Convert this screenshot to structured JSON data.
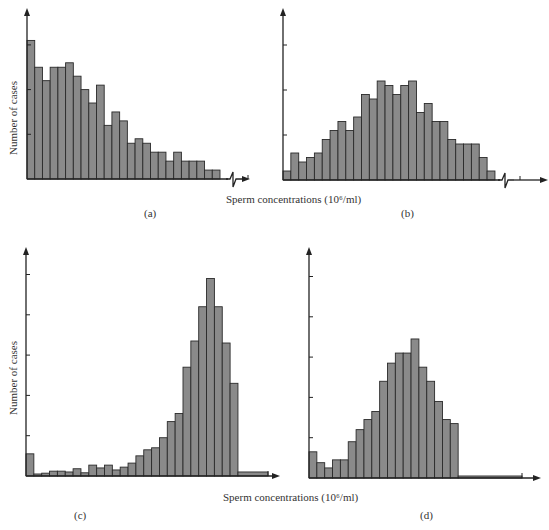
{
  "figure": {
    "ylabel": "Number of cases",
    "xlabel_top": "Sperm concentrations (10⁶/ml)",
    "xlabel_bottom": "Sperm concentrations (10⁶/ml)",
    "panels": [
      "(a)",
      "(b)",
      "(c)",
      "(d)"
    ]
  },
  "chart_data": [
    {
      "type": "bar",
      "panel": "(a)",
      "title": "",
      "xlabel": "Sperm concentrations (10^6/ml)",
      "ylabel": "Number of cases",
      "units": "y in tick intervals (3 ticks shown above baseline)",
      "grid": false,
      "x_axis_break": true,
      "values": [
        3.1,
        2.5,
        2.2,
        2.5,
        2.5,
        2.6,
        2.3,
        2.0,
        1.7,
        2.1,
        1.2,
        1.5,
        1.3,
        0.8,
        0.9,
        0.8,
        0.6,
        0.6,
        0.4,
        0.6,
        0.4,
        0.4,
        0.4,
        0.2,
        0.2
      ],
      "ylim": [
        0,
        3.5
      ]
    },
    {
      "type": "bar",
      "panel": "(b)",
      "title": "",
      "xlabel": "Sperm concentrations (10^6/ml)",
      "ylabel": "",
      "units": "y in tick intervals (3 ticks shown above baseline)",
      "grid": false,
      "x_axis_break": true,
      "values": [
        0.2,
        0.6,
        0.4,
        0.5,
        0.6,
        0.9,
        1.1,
        1.3,
        1.1,
        1.4,
        1.9,
        1.8,
        2.2,
        2.1,
        1.9,
        2.1,
        2.2,
        1.5,
        1.7,
        1.3,
        1.3,
        0.9,
        0.8,
        0.8,
        0.8,
        0.5,
        0.2
      ],
      "ylim": [
        0,
        3.5
      ]
    },
    {
      "type": "bar",
      "panel": "(c)",
      "title": "",
      "xlabel": "Sperm concentrations (10^6/ml)",
      "ylabel": "Number of cases",
      "units": "y in tick intervals (5 ticks shown above baseline)",
      "grid": false,
      "values": [
        0.55,
        0.05,
        0.07,
        0.12,
        0.12,
        0.1,
        0.18,
        0.08,
        0.27,
        0.2,
        0.27,
        0.15,
        0.22,
        0.32,
        0.5,
        0.65,
        0.7,
        0.95,
        1.35,
        1.55,
        2.7,
        3.35,
        4.2,
        4.9,
        4.2,
        3.3,
        2.3
      ],
      "tail_value": 0.1,
      "ylim": [
        0,
        5.5
      ]
    },
    {
      "type": "bar",
      "panel": "(d)",
      "title": "",
      "xlabel": "Sperm concentrations (10^6/ml)",
      "ylabel": "",
      "units": "y in tick intervals (5 ticks shown above baseline)",
      "grid": false,
      "values": [
        0.65,
        0.38,
        0.25,
        0.45,
        0.45,
        0.9,
        1.2,
        1.45,
        1.65,
        2.4,
        2.85,
        3.1,
        3.1,
        3.45,
        2.75,
        2.4,
        1.9,
        1.45,
        1.35
      ],
      "tail_value": 0.05,
      "ylim": [
        0,
        5.5
      ]
    }
  ]
}
